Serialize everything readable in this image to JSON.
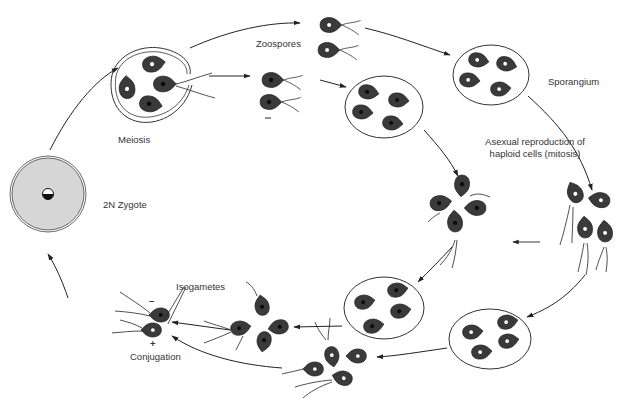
{
  "diagram": {
    "labels": {
      "zoospores": "Zoospores",
      "sporangium": "Sporangium",
      "meiosis": "Meiosis",
      "zygote": "2N Zygote",
      "asexual_line1": "Asexual reproduction of",
      "asexual_line2": "haploid cells (mitosis)",
      "isogametes": "Isogametes",
      "minus_sign": "–",
      "plus_sign": "+",
      "conjugation": "Conjugation"
    },
    "colors": {
      "cell_fill": "#3a3a3a",
      "cell_texture": "#555555",
      "zygote_fill": "#d4d4d4",
      "line": "#222222",
      "background": "#ffffff"
    },
    "nodes": [
      {
        "id": "zygote",
        "label": "2N Zygote"
      },
      {
        "id": "meiosis-cyst",
        "label": "Meiosis"
      },
      {
        "id": "zoospores-top",
        "label": "Zoospores"
      },
      {
        "id": "zoospores-mid",
        "label": ""
      },
      {
        "id": "sporangium-right",
        "label": "Sporangium"
      },
      {
        "id": "sporangium-mid",
        "label": ""
      },
      {
        "id": "released-cells-right",
        "label": ""
      },
      {
        "id": "released-cells-mid",
        "label": ""
      },
      {
        "id": "sporangium-bottom-right",
        "label": ""
      },
      {
        "id": "sporangium-bottom-mid",
        "label": ""
      },
      {
        "id": "cells-bottom-left",
        "label": ""
      },
      {
        "id": "cells-bottom-center",
        "label": ""
      },
      {
        "id": "isogametes-conjugation",
        "label": "Isogametes / Conjugation"
      }
    ]
  }
}
